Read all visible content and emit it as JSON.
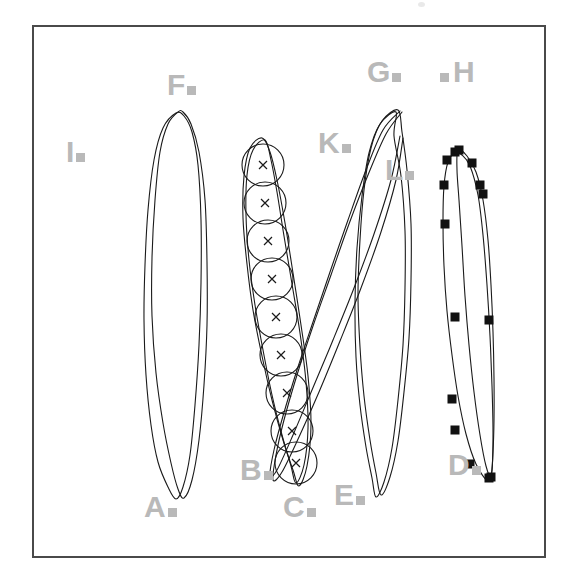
{
  "figure": {
    "kind": "technical-line-diagram",
    "background": "#ffffff",
    "frame": {
      "x": 33,
      "y": 26,
      "width": 512,
      "height": 531,
      "stroke": "#4a4a4a",
      "stroke_width": 2
    },
    "label_color": "#b9b9b9",
    "curve_color": "#1a1a1a",
    "marker_color": "#111111"
  },
  "labels": [
    {
      "id": "A",
      "text": "A",
      "x": 144,
      "y": 492,
      "marker": true
    },
    {
      "id": "B",
      "text": "B",
      "x": 240,
      "y": 455,
      "marker": true
    },
    {
      "id": "C",
      "text": "C",
      "x": 283,
      "y": 492,
      "marker": true
    },
    {
      "id": "D",
      "text": "D",
      "x": 448,
      "y": 450,
      "marker": true
    },
    {
      "id": "E",
      "text": "E",
      "x": 334,
      "y": 480,
      "marker": true
    },
    {
      "id": "F",
      "text": "F",
      "x": 167,
      "y": 70,
      "marker": true
    },
    {
      "id": "G",
      "text": "G",
      "x": 367,
      "y": 57,
      "marker": true
    },
    {
      "id": "H",
      "text": "H",
      "x": 440,
      "y": 57,
      "marker": true,
      "leading_marker": true
    },
    {
      "id": "I",
      "text": "I",
      "x": 66,
      "y": 137,
      "marker": true
    },
    {
      "id": "K",
      "text": "K",
      "x": 318,
      "y": 128,
      "marker": true
    },
    {
      "id": "L",
      "text": "L",
      "x": 385,
      "y": 155,
      "marker": true
    }
  ],
  "chart_data": {
    "type": "line",
    "title": "",
    "xlabel": "",
    "ylabel": "",
    "grid": false,
    "legend": "none",
    "series": [
      {
        "name": "A",
        "marker": "none",
        "closed": true,
        "points": [
          [
            176,
            113
          ],
          [
            163,
            128
          ],
          [
            154,
            160
          ],
          [
            148,
            210
          ],
          [
            145,
            265
          ],
          [
            144,
            320
          ],
          [
            146,
            375
          ],
          [
            151,
            425
          ],
          [
            158,
            462
          ],
          [
            168,
            487
          ],
          [
            176,
            499
          ],
          [
            183,
            487
          ],
          [
            190,
            455
          ],
          [
            195,
            405
          ],
          [
            199,
            345
          ],
          [
            201,
            283
          ],
          [
            201,
            220
          ],
          [
            198,
            165
          ],
          [
            192,
            132
          ],
          [
            184,
            116
          ]
        ]
      },
      {
        "name": "F",
        "marker": "none",
        "closed": true,
        "points": [
          [
            178,
            112
          ],
          [
            168,
            124
          ],
          [
            160,
            152
          ],
          [
            155,
            200
          ],
          [
            152,
            258
          ],
          [
            152,
            316
          ],
          [
            156,
            373
          ],
          [
            163,
            423
          ],
          [
            171,
            463
          ],
          [
            178,
            489
          ],
          [
            184,
            498
          ],
          [
            192,
            480
          ],
          [
            199,
            440
          ],
          [
            204,
            385
          ],
          [
            207,
            325
          ],
          [
            207,
            262
          ],
          [
            205,
            200
          ],
          [
            199,
            152
          ],
          [
            191,
            124
          ],
          [
            183,
            112
          ]
        ]
      },
      {
        "name": "B",
        "marker": "cross-in-circle",
        "closed": true,
        "points": [
          [
            265,
            140
          ],
          [
            253,
            150
          ],
          [
            247,
            175
          ],
          [
            246,
            215
          ],
          [
            249,
            260
          ],
          [
            255,
            305
          ],
          [
            263,
            350
          ],
          [
            272,
            395
          ],
          [
            282,
            435
          ],
          [
            291,
            466
          ],
          [
            296,
            483
          ],
          [
            304,
            465
          ],
          [
            308,
            428
          ],
          [
            306,
            382
          ],
          [
            300,
            333
          ],
          [
            292,
            284
          ],
          [
            284,
            236
          ],
          [
            277,
            192
          ],
          [
            271,
            160
          ]
        ],
        "marker_points": [
          [
            263,
            165
          ],
          [
            265,
            203
          ],
          [
            268,
            241
          ],
          [
            272,
            279
          ],
          [
            276,
            317
          ],
          [
            281,
            355
          ],
          [
            287,
            393
          ],
          [
            292,
            431
          ],
          [
            296,
            463
          ]
        ]
      },
      {
        "name": "C",
        "marker": "none",
        "closed": true,
        "points": [
          [
            262,
            138
          ],
          [
            250,
            148
          ],
          [
            244,
            176
          ],
          [
            243,
            218
          ],
          [
            247,
            264
          ],
          [
            253,
            310
          ],
          [
            262,
            356
          ],
          [
            272,
            400
          ],
          [
            283,
            440
          ],
          [
            293,
            470
          ],
          [
            299,
            486
          ],
          [
            307,
            466
          ],
          [
            311,
            425
          ],
          [
            308,
            376
          ],
          [
            301,
            325
          ],
          [
            293,
            273
          ],
          [
            285,
            223
          ],
          [
            277,
            180
          ],
          [
            270,
            152
          ]
        ]
      },
      {
        "name": "E",
        "marker": "none",
        "closed": true,
        "points": [
          [
            396,
            112
          ],
          [
            380,
            124
          ],
          [
            369,
            153
          ],
          [
            362,
            196
          ],
          [
            357,
            248
          ],
          [
            355,
            303
          ],
          [
            356,
            357
          ],
          [
            360,
            405
          ],
          [
            366,
            447
          ],
          [
            372,
            478
          ],
          [
            376,
            497
          ],
          [
            384,
            482
          ],
          [
            392,
            448
          ],
          [
            398,
            400
          ],
          [
            403,
            345
          ],
          [
            405,
            288
          ],
          [
            405,
            231
          ],
          [
            401,
            176
          ],
          [
            394,
            136
          ]
        ]
      },
      {
        "name": "G",
        "marker": "none",
        "closed": true,
        "points": [
          [
            398,
            110
          ],
          [
            382,
            121
          ],
          [
            371,
            148
          ],
          [
            364,
            190
          ],
          [
            360,
            240
          ],
          [
            358,
            294
          ],
          [
            360,
            347
          ],
          [
            364,
            396
          ],
          [
            370,
            440
          ],
          [
            376,
            473
          ],
          [
            381,
            495
          ],
          [
            390,
            477
          ],
          [
            398,
            441
          ],
          [
            404,
            392
          ],
          [
            409,
            338
          ],
          [
            411,
            281
          ],
          [
            411,
            224
          ],
          [
            407,
            170
          ],
          [
            402,
            132
          ]
        ]
      },
      {
        "name": "K",
        "marker": "none",
        "closed": false,
        "points": [
          [
            400,
            111
          ],
          [
            383,
            130
          ],
          [
            366,
            170
          ],
          [
            348,
            220
          ],
          [
            330,
            272
          ],
          [
            313,
            322
          ],
          [
            297,
            370
          ],
          [
            283,
            416
          ],
          [
            274,
            450
          ],
          [
            270,
            475
          ],
          [
            277,
            470
          ],
          [
            293,
            435
          ],
          [
            312,
            390
          ],
          [
            333,
            340
          ],
          [
            354,
            288
          ],
          [
            374,
            234
          ],
          [
            391,
            180
          ],
          [
            400,
            136
          ]
        ]
      },
      {
        "name": "L",
        "marker": "none",
        "closed": false,
        "points": [
          [
            402,
            112
          ],
          [
            386,
            134
          ],
          [
            368,
            175
          ],
          [
            349,
            224
          ],
          [
            331,
            275
          ],
          [
            313,
            326
          ],
          [
            297,
            375
          ],
          [
            284,
            420
          ],
          [
            276,
            455
          ],
          [
            273,
            480
          ],
          [
            282,
            472
          ],
          [
            299,
            437
          ],
          [
            319,
            392
          ],
          [
            340,
            341
          ],
          [
            361,
            288
          ],
          [
            381,
            232
          ],
          [
            396,
            180
          ],
          [
            403,
            138
          ]
        ]
      },
      {
        "name": "D",
        "marker": "square",
        "closed": true,
        "points": [
          [
            455,
            153
          ],
          [
            448,
            162
          ],
          [
            444,
            186
          ],
          [
            443,
            222
          ],
          [
            444,
            266
          ],
          [
            447,
            311
          ],
          [
            452,
            355
          ],
          [
            458,
            396
          ],
          [
            466,
            434
          ],
          [
            476,
            464
          ],
          [
            488,
            481
          ],
          [
            492,
            470
          ],
          [
            493,
            432
          ],
          [
            492,
            386
          ],
          [
            490,
            336
          ],
          [
            487,
            285
          ],
          [
            483,
            235
          ],
          [
            478,
            195
          ],
          [
            470,
            166
          ],
          [
            462,
            155
          ]
        ],
        "marker_points": [
          [
            455,
            152
          ],
          [
            447,
            160
          ],
          [
            444,
            185
          ],
          [
            445,
            224
          ],
          [
            455,
            317
          ],
          [
            452,
            399
          ],
          [
            455,
            430
          ],
          [
            470,
            464
          ],
          [
            489,
            478
          ]
        ]
      },
      {
        "name": "H",
        "marker": "square",
        "closed": true,
        "points": [
          [
            458,
            150
          ],
          [
            467,
            156
          ],
          [
            476,
            172
          ],
          [
            483,
            200
          ],
          [
            488,
            240
          ],
          [
            491,
            285
          ],
          [
            493,
            332
          ],
          [
            494,
            378
          ],
          [
            494,
            420
          ],
          [
            493,
            452
          ],
          [
            491,
            476
          ],
          [
            486,
            466
          ],
          [
            480,
            435
          ],
          [
            474,
            392
          ],
          [
            469,
            345
          ],
          [
            465,
            296
          ],
          [
            462,
            246
          ],
          [
            459,
            200
          ],
          [
            457,
            170
          ]
        ],
        "marker_points": [
          [
            459,
            150
          ],
          [
            472,
            163
          ],
          [
            480,
            185
          ],
          [
            483,
            194
          ],
          [
            489,
            320
          ],
          [
            491,
            477
          ]
        ]
      },
      {
        "name": "I",
        "marker": "none",
        "closed": false,
        "points": []
      }
    ]
  }
}
